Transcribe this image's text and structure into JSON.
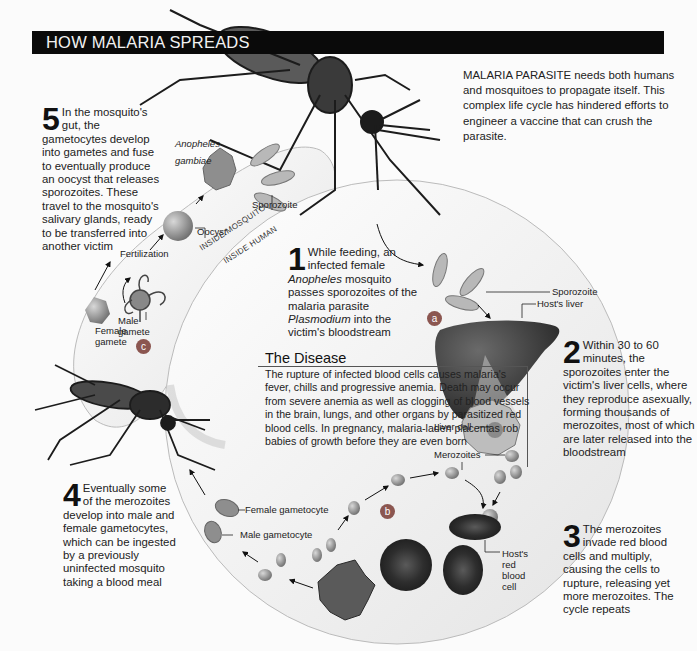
{
  "header": {
    "title": "HOW MALARIA SPREADS",
    "bar_color": "#0a0a0a"
  },
  "intro": {
    "text": "MALARIA PARASITE needs both humans and mosquitoes to propagate itself. This complex life cycle has hindered efforts to engineer a vaccine that can crush the parasite."
  },
  "species_label": {
    "line1": "Anopheles",
    "line2": "gambiae"
  },
  "zones": {
    "mosquito": "INSIDE MOSQUITO",
    "human": "INSIDE HUMAN"
  },
  "steps": [
    {
      "number": "1",
      "text_pre": "While feeding, an infected female ",
      "italic1": "Anopheles",
      "text_mid": " mosquito passes sporozoites of the malaria parasite ",
      "italic2": "Plasmodium",
      "text_post": " into the victim's bloodstream"
    },
    {
      "number": "2",
      "text": "Within 30 to 60 minutes, the sporozoites enter the victim's liver cells, where they reproduce asexually, forming thousands of merozoites, most of which are later released into the bloodstream"
    },
    {
      "number": "3",
      "text": "The merozoites invade red blood cells and multiply, causing the cells to rupture, releasing yet more merozoites. The cycle repeats"
    },
    {
      "number": "4",
      "text": "Eventually some of the merozoites develop into male and female gametocytes, which can be ingested by a previously uninfected mosquito taking a blood meal"
    },
    {
      "number": "5",
      "text": "In the mosquito's gut, the gametocytes develop into gametes and fuse to eventually produce an oocyst that releases sporozoites. These travel to the mosquito's salivary glands, ready to be transferred into another victim"
    }
  ],
  "disease": {
    "title": "The Disease",
    "text": "The rupture of infected blood cells causes malaria's fever, chills and progressive anemia. Death may occur from severe anemia as well as clogging of blood vessels in the brain, lungs, and other organs by parasitized red blood cells. In pregnancy, malaria-laden placentas rob babies of growth before they are even born"
  },
  "labels": {
    "sporozoite_mosquito": "Sporozoite",
    "oocyst": "Oocyst",
    "fertilization": "Fertilization",
    "male_gamete": [
      "Male",
      "gamete"
    ],
    "female_gamete": [
      "Female",
      "gamete"
    ],
    "sporozoite_human": "Sporozoite",
    "hosts_liver": "Host's liver",
    "liver_cell": "Liver cell",
    "merozoites": "Merozoites",
    "hosts_rbc": [
      "Host's",
      "red",
      "blood",
      "cell"
    ],
    "female_gametocyte": "Female gametocyte",
    "male_gametocyte": "Male gametocyte"
  },
  "badges": [
    {
      "id": "a",
      "label": "a"
    },
    {
      "id": "b",
      "label": "b"
    },
    {
      "id": "c",
      "label": "c"
    }
  ],
  "colors": {
    "badge": "#8b5650",
    "background": "#fbfbfb",
    "cell_gray": "#9a9a9a",
    "liver": "#3d3d3d"
  }
}
